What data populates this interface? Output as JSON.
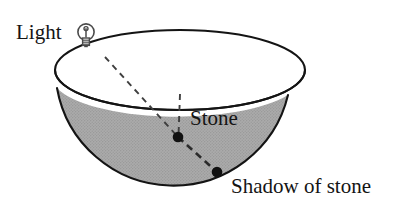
{
  "figure": {
    "background_color": "#ffffff",
    "width": 410,
    "height": 212
  },
  "labels": {
    "light": "Light",
    "stone": "Stone",
    "shadow": "Shadow of stone"
  },
  "icons": {
    "light_bulb": "light-bulb-icon"
  },
  "colors": {
    "outline": "#141414",
    "shaded_region": "#a8a8a8",
    "shaded_region_texture": "#9a9a9a",
    "dashed_line": "#3c3c3c",
    "dot": "#111111",
    "text": "#141414",
    "bulb_stroke": "#4a4a4a"
  },
  "geometry": {
    "bowl_rim_ellipse": {
      "cx": 180,
      "cy": 70,
      "rx": 125,
      "ry": 40
    },
    "bowl_outer_circle": {
      "cx": 172,
      "cy": 73,
      "r": 116
    },
    "left_tangent_point": {
      "x": 57,
      "y": 88
    },
    "right_tangent_point": {
      "x": 288,
      "y": 95
    },
    "bowl_bottom_point": {
      "x": 177,
      "y": 188
    },
    "light_source_point": {
      "x": 105,
      "y": 57
    },
    "stone_point": {
      "x": 178,
      "y": 137
    },
    "shadow_point": {
      "x": 217,
      "y": 172
    },
    "vertical_dash_top": {
      "x": 180,
      "y": 94
    },
    "stone_dot_radius": 5.2,
    "shadow_dot_radius": 5.2
  }
}
